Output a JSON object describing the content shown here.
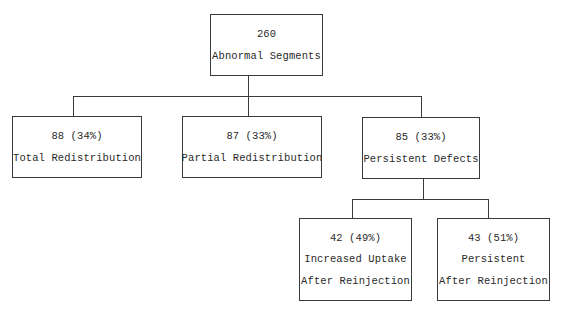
{
  "diagram": {
    "root": {
      "value": "260",
      "label": "Abnormal Segments"
    },
    "level1": [
      {
        "value": "88 (34%)",
        "label": "Total Redistribution"
      },
      {
        "value": "87 (33%)",
        "label": "Partial Redistribution"
      },
      {
        "value": "85 (33%)",
        "label": "Persistent Defects"
      }
    ],
    "level2": [
      {
        "value": "42 (49%)",
        "label_line1": "Increased Uptake",
        "label_line2": "After Reinjection"
      },
      {
        "value": "43 (51%)",
        "label_line1": "Persistent",
        "label_line2": "After Reinjection"
      }
    ]
  }
}
